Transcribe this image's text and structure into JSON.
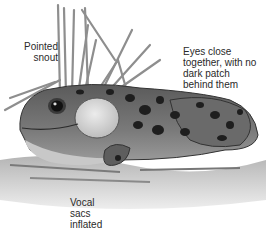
{
  "figure": {
    "labels": {
      "snout": "Pointed snout",
      "snout_line1": "Pointed",
      "snout_line2": "snout",
      "eyes_line1": "Eyes close",
      "eyes_line2": "together, with no",
      "eyes_line3": "dark patch",
      "eyes_line4": "behind them",
      "vocal_line1": "Vocal",
      "vocal_line2": "sacs",
      "vocal_line3": "inflated"
    },
    "colors": {
      "body": "#6f6f6f",
      "spots": "#1e1e1e",
      "vocal_sac": "#d8d8d8",
      "belly": "#c8c8c8",
      "reeds": "#9a9a9a",
      "water": "#a8a8a8",
      "text": "#2a2a2a"
    }
  }
}
